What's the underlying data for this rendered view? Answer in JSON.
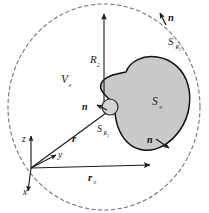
{
  "figure": {
    "domain": "Diagram",
    "kind": "electromagnetics-surface-integral-geometry",
    "background_color": "#ffffff",
    "width": 209,
    "height": 213,
    "colors": {
      "outer_circle_stroke": "#6d6d6d",
      "blob_fill": "#c9c9c9",
      "blob_stroke": "#111111",
      "inner_circle_fill": "#d4d4d4",
      "inner_circle_stroke": "#222222",
      "line_stroke": "#1a1a1a",
      "text": "#1a1a1a"
    },
    "outer_boundary": {
      "name": "far-sphere-boundary",
      "style": "dashed",
      "center_x": 104,
      "center_y": 107,
      "radius_x": 96,
      "radius_y": 103
    },
    "labels": {
      "outer_surface": {
        "base": "S",
        "sub": "R",
        "subsub": "2",
        "x": 172,
        "y": 44
      },
      "outer_normal": {
        "text": "n",
        "x": 170,
        "y": 18
      },
      "radius_R2": {
        "base": "R",
        "sub": "2",
        "x": 92,
        "y": 62
      },
      "volume": {
        "base": "V",
        "sub": "o",
        "x": 63,
        "y": 82
      },
      "inner_normal": {
        "text": "n",
        "x": 84,
        "y": 110
      },
      "inner_surface": {
        "base": "S",
        "sub": "R",
        "subsub": "1",
        "x": 100,
        "y": 132
      },
      "blob_surface": {
        "base": "S",
        "sub": "o",
        "x": 155,
        "y": 104
      },
      "blob_normal": {
        "text": "n",
        "x": 150,
        "y": 143
      },
      "vector_r": {
        "text": "r",
        "x": 74,
        "y": 140
      },
      "vector_r0": {
        "base": "r",
        "sub": "o",
        "x": 90,
        "y": 180
      },
      "axis_z": {
        "text": "z",
        "x": 25,
        "y": 141
      },
      "axis_y": {
        "text": "y",
        "x": 61,
        "y": 157
      },
      "axis_x": {
        "text": "x",
        "x": 26,
        "y": 193
      }
    },
    "objects": {
      "inner_sphere": {
        "name": "excluded-singularity-sphere",
        "center_x": 110,
        "center_y": 107,
        "radius": 8
      },
      "blob": {
        "name": "source-region-blob",
        "path": "M 126 72 C 130 61 143 55 157 57 C 172 59 184 70 188 85 C 192 100 189 117 180 130 C 171 143 157 152 143 150 C 130 148 122 138 118 127 C 114 116 116 106 110 100 C 104 94 99 90 101 84 C 104 76 116 74 126 72 Z"
      },
      "origin": {
        "x": 31,
        "y": 168
      }
    },
    "vectors": [
      {
        "name": "radius-R2-arrow",
        "from_x": 104,
        "from_y": 107,
        "to_x": 104,
        "to_y": 12
      },
      {
        "name": "position-vector-r",
        "from_x": 31,
        "from_y": 168,
        "to_x": 105,
        "to_y": 112
      },
      {
        "name": "position-vector-r0",
        "from_x": 31,
        "from_y": 168,
        "to_x": 150,
        "to_y": 166
      },
      {
        "name": "axis-z",
        "from_x": 31,
        "from_y": 168,
        "to_x": 31,
        "to_y": 134
      },
      {
        "name": "axis-y",
        "from_x": 31,
        "from_y": 168,
        "to_x": 58,
        "to_y": 154
      },
      {
        "name": "axis-x",
        "from_x": 31,
        "from_y": 168,
        "to_x": 28,
        "to_y": 193
      },
      {
        "name": "outer-normal-arrow",
        "from_x": 165,
        "from_y": 24,
        "to_x": 160,
        "to_y": 13
      },
      {
        "name": "inner-normal-arrow",
        "from_x": 105,
        "from_y": 112,
        "to_x": 96,
        "to_y": 107
      },
      {
        "name": "blob-normal-arrow",
        "from_x": 155,
        "from_y": 139,
        "to_x": 168,
        "to_y": 147
      }
    ]
  }
}
